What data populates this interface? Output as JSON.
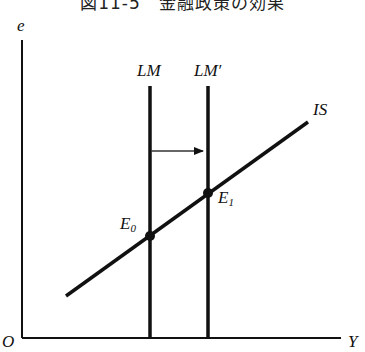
{
  "title": "図11-5　金融政策の効果",
  "axes": {
    "y_label": "e",
    "x_label": "Y",
    "origin_label": "O"
  },
  "curves": {
    "lm": {
      "label": "LM",
      "x": 150
    },
    "lm_prime": {
      "label": "LM′",
      "x": 208
    },
    "is": {
      "label": "IS",
      "x1": 66,
      "y1": 296,
      "x2": 308,
      "y2": 122
    }
  },
  "points": {
    "e0": {
      "label": "E",
      "sub": "0",
      "x": 150,
      "y": 236
    },
    "e1": {
      "label": "E",
      "sub": "1",
      "x": 208,
      "y": 193
    }
  },
  "arrow": {
    "from_x": 150,
    "to_x": 202,
    "y": 151,
    "meaning": "LM shifts right to LM′"
  },
  "colors": {
    "ink": "#111111",
    "arrow": "#333333",
    "background": "#ffffff"
  }
}
